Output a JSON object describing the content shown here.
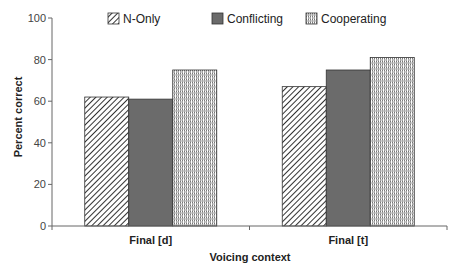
{
  "chart_data": {
    "type": "bar",
    "title": "",
    "xlabel": "Voicing context",
    "ylabel": "Percent correct",
    "ylim": [
      0,
      100
    ],
    "yticks": [
      0,
      20,
      40,
      60,
      80,
      100
    ],
    "grid": false,
    "legend_position": "top",
    "categories": [
      "Final [d]",
      "Final [t]"
    ],
    "series": [
      {
        "name": "N-Only",
        "pattern": "diagonal-hatch",
        "values": [
          62,
          67
        ]
      },
      {
        "name": "Conflicting",
        "pattern": "solid-dark-gray",
        "values": [
          61,
          75
        ]
      },
      {
        "name": "Cooperating",
        "pattern": "dotted-weave",
        "values": [
          75,
          81
        ]
      }
    ]
  },
  "colors": {
    "axis": "#666666",
    "bar_outline": "#333333",
    "conflicting_fill": "#6b6b6b",
    "hatch": "#333333"
  }
}
